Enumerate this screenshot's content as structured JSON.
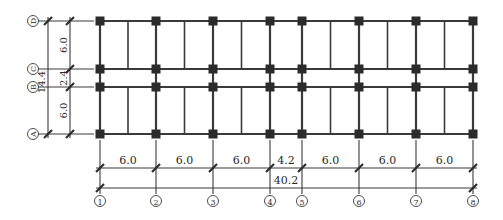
{
  "diagram": {
    "type": "structural-floor-plan-grid",
    "colors": {
      "line": "#3a3a3a",
      "column": "#2b2b2b",
      "text": "#2a2a2a",
      "background": "#ffffff"
    },
    "vertical_axes": [
      {
        "label": "①",
        "x": 100
      },
      {
        "label": "②",
        "x": 156
      },
      {
        "label": "③",
        "x": 213
      },
      {
        "label": "④",
        "x": 270
      },
      {
        "label": "⑤",
        "x": 302
      },
      {
        "label": "⑥",
        "x": 359
      },
      {
        "label": "⑦",
        "x": 416
      },
      {
        "label": "⑧",
        "x": 473
      }
    ],
    "horizontal_axes": [
      {
        "label": "Ⓓ",
        "y": 21
      },
      {
        "label": "Ⓒ",
        "y": 69
      },
      {
        "label": "Ⓑ",
        "y": 87
      },
      {
        "label": "Ⓐ",
        "y": 134
      }
    ],
    "bay_dimensions": [
      "6.0",
      "6.0",
      "6.0",
      "4.2",
      "6.0",
      "6.0",
      "6.0"
    ],
    "total_length": "40.2",
    "span_dimensions": [
      "6.0",
      "2.4",
      "6.0"
    ],
    "total_width": "14.4"
  }
}
